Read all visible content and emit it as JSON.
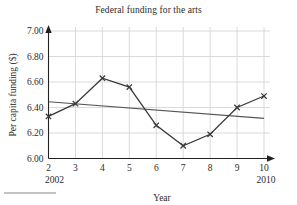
{
  "chart_data": {
    "type": "line",
    "title": "Federal funding for the arts",
    "xlabel": "Year",
    "ylabel": "Per capita funding ($)",
    "x": [
      2,
      3,
      4,
      5,
      6,
      7,
      8,
      9,
      10
    ],
    "xtick_labels": [
      "2",
      "3",
      "4",
      "5",
      "6",
      "7",
      "8",
      "9",
      "10"
    ],
    "x_edge_labels": {
      "left": "2002",
      "right": "2010"
    },
    "xlim": [
      2,
      10
    ],
    "ytick_labels": [
      "6.00",
      "6.20",
      "6.40",
      "6.60",
      "6.80",
      "7.00"
    ],
    "ytick_values": [
      6.0,
      6.2,
      6.4,
      6.6,
      6.8,
      7.0
    ],
    "ylim": [
      6.0,
      7.0
    ],
    "grid": true,
    "legend": "none",
    "series": [
      {
        "name": "Per capita funding",
        "marker": "x",
        "values": [
          6.33,
          6.43,
          6.63,
          6.56,
          6.26,
          6.1,
          6.19,
          6.4,
          6.49
        ]
      },
      {
        "name": "Trend line",
        "marker": "none",
        "endpoints": [
          {
            "x": 2,
            "y": 6.445
          },
          {
            "x": 10,
            "y": 6.315
          }
        ]
      }
    ],
    "colors": {
      "data_line": "#3a3a3a",
      "trend_line": "#555555",
      "grid": "#d6d6d6",
      "axis": "#222222",
      "text": "#2b2b2b"
    }
  }
}
